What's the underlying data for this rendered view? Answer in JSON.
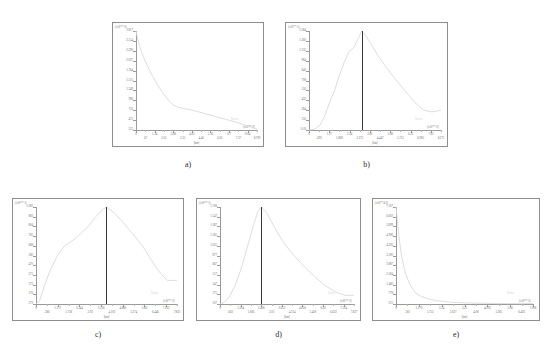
{
  "figure": {
    "panel_count": 5,
    "background": "#ffffff",
    "curve_color": "#d9d9d9",
    "axis_color": "#9a9a9a",
    "marker_color": "#3a3a3a"
  },
  "chart_data": [
    {
      "id": "a",
      "caption": "a)",
      "type": "line",
      "title": "",
      "xlabel": "[km]",
      "ylabel": "",
      "y_exponent_label": "(x10**-2)",
      "x_exponent_label": "(x10**-2)",
      "legend": "Series",
      "ylim": [
        225,
        2817
      ],
      "xlim": [
        0,
        8.709
      ],
      "grid": false,
      "yticks": [
        "2.817",
        "2.554",
        "2.290",
        "2.027",
        "1.764",
        "1.515",
        "1.249",
        "996",
        "750",
        "475",
        "225"
      ],
      "xticks": [
        "0",
        ".67",
        "1.34",
        "2.01",
        "2.68",
        "3.35",
        "4.02",
        "4.46",
        "5.36",
        "6.03",
        "6.7",
        "7.37",
        "8.04",
        "8.709"
      ],
      "x": [
        0,
        0.12,
        0.3,
        0.55,
        0.85,
        1.2,
        1.6,
        2.0,
        2.4,
        2.68,
        3.0,
        3.4,
        3.9,
        4.5,
        5.1,
        5.8,
        6.5,
        7.2,
        7.8,
        8.3,
        8.709
      ],
      "values": [
        2817,
        2620,
        2380,
        2130,
        1880,
        1630,
        1380,
        1160,
        980,
        880,
        820,
        790,
        760,
        700,
        640,
        570,
        500,
        430,
        360,
        300,
        250
      ],
      "marker_x": null
    },
    {
      "id": "b",
      "caption": "b)",
      "type": "line",
      "title": "",
      "xlabel": "[km]",
      "ylabel": "",
      "y_exponent_label": "(x10**-1)",
      "x_exponent_label": "(x10**-2)",
      "legend": "Series",
      "ylim": [
        0.18,
        1.384
      ],
      "xlim": [
        0,
        8.271
      ],
      "grid": false,
      "yticks": [
        "1.384",
        "1.260",
        "1.133",
        "984",
        "840",
        "708",
        "550",
        "432",
        "284",
        "150",
        "0.18"
      ],
      "xticks": [
        "0",
        ".693",
        "1.27",
        "1.869",
        "2.54",
        "3.173",
        "3.81",
        "4.447",
        "5.08",
        "5.715",
        "6.35",
        "6.985",
        "7.62",
        "8.271"
      ],
      "x": [
        0,
        0.35,
        0.7,
        1.0,
        1.3,
        1.6,
        1.9,
        2.2,
        2.5,
        2.8,
        3.05,
        3.3,
        3.55,
        3.9,
        4.3,
        4.8,
        5.4,
        6.0,
        6.6,
        7.2,
        7.7,
        8.271
      ],
      "values": [
        0.18,
        0.19,
        0.24,
        0.36,
        0.52,
        0.66,
        0.84,
        1.0,
        1.13,
        1.18,
        1.28,
        1.384,
        1.33,
        1.22,
        1.09,
        0.95,
        0.8,
        0.66,
        0.52,
        0.42,
        0.4,
        0.42
      ],
      "marker_x": 3.3
    },
    {
      "id": "c",
      "caption": "c)",
      "type": "line",
      "title": "",
      "xlabel": "[km]",
      "ylabel": "",
      "y_exponent_label": "(x10**-1)",
      "x_exponent_label": "(x10**-2)",
      "legend": "Series",
      "ylim": [
        273,
        1083
      ],
      "xlim": [
        0,
        7.822
      ],
      "grid": false,
      "yticks": [
        "1.083",
        "883",
        "804",
        "781",
        "688",
        "580",
        "470",
        "371",
        "273",
        "176",
        "273"
      ],
      "xticks": [
        "0",
        ".586",
        "1.172",
        "1.758",
        "2.344",
        "2.93",
        "3.516",
        "4.102",
        "4.688",
        "5.274",
        "5.86",
        "6.446",
        "7.032",
        "7.822"
      ],
      "x": [
        0,
        0.2,
        0.45,
        0.8,
        1.2,
        1.6,
        2.0,
        2.4,
        2.9,
        3.3,
        3.7,
        3.9,
        4.3,
        4.8,
        5.3,
        5.9,
        6.4,
        6.9,
        7.3,
        7.822
      ],
      "values": [
        275,
        300,
        420,
        560,
        680,
        760,
        800,
        850,
        920,
        1000,
        1060,
        1083,
        1040,
        960,
        870,
        760,
        640,
        530,
        470,
        470
      ],
      "marker_x": 3.9
    },
    {
      "id": "d",
      "caption": "d)",
      "type": "line",
      "title": "",
      "xlabel": "[km]",
      "ylabel": "",
      "y_exponent_label": "(x10**-1)",
      "x_exponent_label": "(x10**-2)",
      "legend": "Series",
      "ylim": [
        107,
        1706
      ],
      "xlim": [
        0,
        7.827
      ],
      "grid": false,
      "yticks": [
        "1.706",
        "1.547",
        "1.387",
        "1.185",
        "1.025",
        "877",
        "667",
        "517",
        "347",
        "175",
        "107"
      ],
      "xticks": [
        "0",
        ".602",
        "1.204",
        "1.806",
        "2.408",
        "3.01",
        "3.612",
        "4.214",
        "4.816",
        "5.418",
        "6.02",
        "6.622",
        "7.224",
        "7.827"
      ],
      "x": [
        0,
        0.25,
        0.55,
        0.9,
        1.25,
        1.6,
        1.95,
        2.2,
        2.41,
        2.7,
        3.0,
        3.4,
        3.9,
        4.4,
        5.0,
        5.6,
        6.2,
        6.8,
        7.3,
        7.827
      ],
      "values": [
        110,
        130,
        230,
        420,
        700,
        1050,
        1400,
        1620,
        1706,
        1620,
        1470,
        1260,
        1050,
        880,
        700,
        540,
        400,
        300,
        250,
        250
      ],
      "marker_x": 2.41
    },
    {
      "id": "e",
      "caption": "e)",
      "type": "line",
      "title": "",
      "xlabel": "[km]",
      "ylabel": "",
      "y_exponent_label": "(x10**4-2)",
      "x_exponent_label": "(x10**-2)",
      "legend": "Series",
      "ylim": [
        215,
        7107
      ],
      "xlim": [
        0,
        7.008
      ],
      "grid": false,
      "yticks": [
        "7.107",
        "6.602",
        "5.899",
        "4.996",
        "4.293",
        "3.590",
        "2.887",
        "2.184",
        "1.480",
        "778",
        "215"
      ],
      "xticks": [
        "0",
        ".581",
        "1.170",
        "1.755",
        "2.34",
        "2.627",
        "3.51",
        "4.08",
        "4.095",
        "5.285",
        "5.86",
        "6.403",
        "7.008"
      ],
      "x": [
        0,
        0.06,
        0.15,
        0.3,
        0.5,
        0.75,
        1.0,
        1.3,
        1.7,
        2.1,
        2.6,
        3.1,
        3.7,
        4.3,
        5.0,
        5.7,
        6.3,
        7.008
      ],
      "values": [
        7107,
        6300,
        5000,
        3500,
        2300,
        1500,
        1000,
        750,
        560,
        440,
        370,
        320,
        290,
        270,
        255,
        245,
        240,
        250
      ],
      "marker_x": null
    }
  ]
}
